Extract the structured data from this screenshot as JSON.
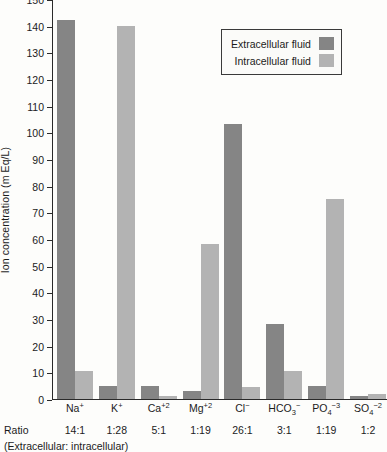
{
  "chart_data": {
    "type": "bar",
    "title": "",
    "xlabel": "",
    "ylabel": "Ion concentration (m Eq/L)",
    "ylim": [
      0,
      150
    ],
    "ytick_step": 10,
    "grid": false,
    "legend_position": "upper-right",
    "categories": [
      "Na+",
      "K+",
      "Ca+2",
      "Mg+2",
      "Cl-",
      "HCO3-",
      "PO4-3",
      "SO4-2"
    ],
    "category_labels": [
      {
        "base": "Na",
        "sup": "+",
        "sub": ""
      },
      {
        "base": "K",
        "sup": "+",
        "sub": ""
      },
      {
        "base": "Ca",
        "sup": "+2",
        "sub": ""
      },
      {
        "base": "Mg",
        "sup": "+2",
        "sub": ""
      },
      {
        "base": "Cl",
        "sup": "−",
        "sub": ""
      },
      {
        "base": "HCO",
        "sup": "−",
        "sub": "3"
      },
      {
        "base": "PO",
        "sup": "−3",
        "sub": "4"
      },
      {
        "base": "SO",
        "sup": "−2",
        "sub": "4"
      }
    ],
    "series": [
      {
        "name": "Extracellular fluid",
        "color": "#858585",
        "values": [
          142,
          5,
          5,
          3,
          103,
          28,
          5,
          1
        ]
      },
      {
        "name": "Intracellular fluid",
        "color": "#b3b3b3",
        "values": [
          10.5,
          140,
          1,
          58,
          4.5,
          10.5,
          75,
          2
        ]
      }
    ],
    "ytick_labels": [
      "0",
      "10",
      "20",
      "30",
      "40",
      "50",
      "60",
      "70",
      "80",
      "90",
      "100",
      "110",
      "120",
      "130",
      "140",
      "150"
    ],
    "ratio_label": "Ratio",
    "ratios": [
      "14:1",
      "1:28",
      "5:1",
      "1:19",
      "26:1",
      "3:1",
      "1:19",
      "1:2"
    ],
    "ratio_caption": "(Extracellular: intracellular)"
  },
  "legend": {
    "items": [
      {
        "label": "Extracellular fluid",
        "swatch": "extra"
      },
      {
        "label": "Intracellular fluid",
        "swatch": "intra"
      }
    ]
  }
}
